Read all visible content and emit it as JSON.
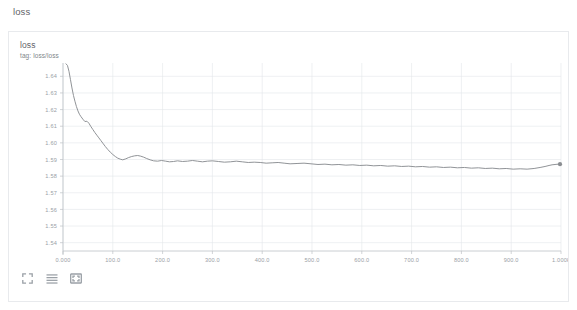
{
  "page": {
    "section_label": "loss"
  },
  "card": {
    "title": "loss",
    "subtitle": "tag: loss/loss"
  },
  "toolbar": {
    "items": [
      {
        "name": "fullscreen-icon",
        "label": "Toggle fullscreen"
      },
      {
        "name": "data-table-icon",
        "label": "Toggle data table"
      },
      {
        "name": "fit-domain-icon",
        "label": "Fit domain to data"
      }
    ]
  },
  "colors": {
    "series": "#8a8d91",
    "grid": "#e3e6ea",
    "axis": "#bdc1c6",
    "tick_text": "#9aa0a6",
    "card_border": "#e8eaed",
    "title_text": "#5f6368"
  },
  "chart_data": {
    "type": "line",
    "title": "loss",
    "subtitle": "tag: loss/loss",
    "xlabel": "",
    "ylabel": "",
    "xlim": [
      0,
      1000
    ],
    "ylim": [
      1.535,
      1.648
    ],
    "grid": true,
    "legend": "none",
    "yticks": [
      1.64,
      1.63,
      1.62,
      1.61,
      1.6,
      1.59,
      1.58,
      1.57,
      1.56,
      1.55,
      1.54
    ],
    "ytick_labels": [
      "1.64",
      "1.63",
      "1.62",
      "1.61",
      "1.60",
      "1.59",
      "1.58",
      "1.57",
      "1.56",
      "1.55",
      "1.54"
    ],
    "xticks": [
      0,
      100,
      200,
      300,
      400,
      500,
      600,
      700,
      800,
      900,
      1000
    ],
    "xtick_labels": [
      "0.000",
      "100.0",
      "200.0",
      "300.0",
      "400.0",
      "500.0",
      "600.0",
      "700.0",
      "800.0",
      "900.0",
      "1.000k"
    ],
    "endpoint_marker": true,
    "series": [
      {
        "name": "loss/loss",
        "color": "#8a8d91",
        "x": [
          6,
          9,
          12,
          15,
          18,
          21,
          24,
          27,
          30,
          33,
          36,
          40,
          44,
          48,
          52,
          56,
          60,
          64,
          68,
          72,
          76,
          80,
          85,
          90,
          95,
          100,
          105,
          110,
          115,
          120,
          126,
          132,
          138,
          144,
          150,
          156,
          162,
          168,
          175,
          182,
          190,
          198,
          206,
          214,
          222,
          230,
          240,
          250,
          260,
          270,
          280,
          290,
          300,
          312,
          324,
          336,
          348,
          360,
          372,
          384,
          396,
          408,
          420,
          432,
          444,
          456,
          470,
          484,
          498,
          512,
          526,
          540,
          554,
          568,
          582,
          596,
          610,
          624,
          638,
          652,
          666,
          680,
          694,
          708,
          722,
          736,
          750,
          764,
          778,
          792,
          806,
          820,
          834,
          848,
          862,
          876,
          890,
          904,
          918,
          932,
          946,
          958,
          968,
          976,
          982,
          988,
          994,
          998
        ],
        "y": [
          1.6475,
          1.6465,
          1.643,
          1.638,
          1.633,
          1.6285,
          1.625,
          1.6218,
          1.6192,
          1.6172,
          1.6158,
          1.6142,
          1.6128,
          1.613,
          1.6118,
          1.6098,
          1.608,
          1.6062,
          1.6046,
          1.603,
          1.6014,
          1.5998,
          1.5978,
          1.596,
          1.5944,
          1.593,
          1.5918,
          1.5908,
          1.5902,
          1.5898,
          1.5904,
          1.5912,
          1.5918,
          1.5922,
          1.5924,
          1.592,
          1.5914,
          1.5906,
          1.5898,
          1.5892,
          1.589,
          1.5894,
          1.589,
          1.5886,
          1.5888,
          1.5892,
          1.5888,
          1.589,
          1.5894,
          1.589,
          1.5886,
          1.589,
          1.5892,
          1.5888,
          1.5884,
          1.5886,
          1.589,
          1.5886,
          1.5882,
          1.5884,
          1.5882,
          1.5878,
          1.588,
          1.5882,
          1.5878,
          1.5874,
          1.5876,
          1.5878,
          1.5874,
          1.587,
          1.5872,
          1.5868,
          1.587,
          1.5866,
          1.5868,
          1.5864,
          1.5866,
          1.5862,
          1.5864,
          1.586,
          1.5862,
          1.5858,
          1.586,
          1.5856,
          1.5858,
          1.5854,
          1.5856,
          1.5852,
          1.5854,
          1.585,
          1.5852,
          1.5848,
          1.585,
          1.5846,
          1.5848,
          1.5844,
          1.5846,
          1.5842,
          1.5844,
          1.5842,
          1.5846,
          1.5852,
          1.5858,
          1.5864,
          1.5868,
          1.587,
          1.5872,
          1.5872
        ]
      }
    ]
  }
}
